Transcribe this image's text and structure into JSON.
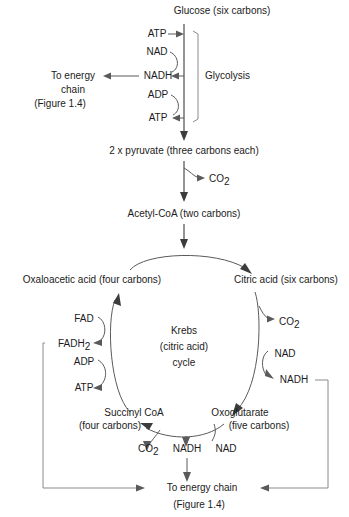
{
  "figure": {
    "colors": {
      "text": "#1b1b1b",
      "line": "#5a5a5a",
      "line_dark": "#3c3c3c",
      "bracket": "#8a8a8a",
      "background": "#ffffff"
    }
  },
  "glycolysis": {
    "start_label": "Glucose (six carbons)",
    "pathway_label": "Glycolysis",
    "inputs_outputs": [
      {
        "label": "ATP",
        "role": "input"
      },
      {
        "label": "NAD",
        "role": "input"
      },
      {
        "label": "NADH",
        "role": "output"
      },
      {
        "label": "ADP",
        "role": "input"
      },
      {
        "label": "ATP",
        "role": "output"
      }
    ],
    "energy_chain": {
      "line1": "To energy",
      "line2": "chain",
      "line3": "(Figure 1.4)"
    },
    "product_label": "2 x pyruvate (three carbons each)"
  },
  "link_reaction": {
    "waste_label": "CO",
    "waste_sub": "2",
    "product_label": "Acetyl-CoA (two carbons)"
  },
  "krebs": {
    "center": {
      "line1": "Krebs",
      "line2": "(citric acid)",
      "line3": "cycle"
    },
    "intermediates": [
      {
        "name": "Oxaloacetic acid (four carbons)",
        "position": "top-left"
      },
      {
        "name": "Citric acid (six carbons)",
        "position": "top-right"
      },
      {
        "name": "Oxoglutarate",
        "sub": "(five carbons)",
        "position": "bottom-right"
      },
      {
        "name": "Succinyl CoA",
        "sub": "(four carbons)",
        "position": "bottom-left"
      }
    ],
    "right_side": [
      {
        "label": "CO",
        "sub": "2",
        "role": "output"
      },
      {
        "label": "NAD",
        "role": "input"
      },
      {
        "label": "NADH",
        "role": "output"
      }
    ],
    "left_side": [
      {
        "label": "FAD",
        "role": "input"
      },
      {
        "label": "FADH",
        "sub": "2",
        "role": "output"
      },
      {
        "label": "ADP",
        "role": "input"
      },
      {
        "label": "ATP",
        "role": "output"
      }
    ],
    "bottom_row": [
      {
        "label": "CO",
        "sub": "2",
        "role": "output"
      },
      {
        "label": "NADH",
        "role": "output"
      },
      {
        "label": "NAD",
        "role": "input"
      }
    ]
  },
  "footer": {
    "energy_chain": "To energy chain",
    "figure_ref": "(Figure 1.4)"
  }
}
